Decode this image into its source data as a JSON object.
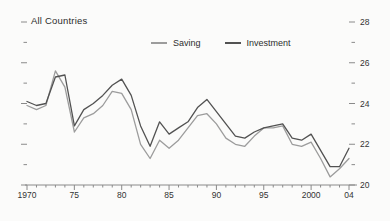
{
  "title": "All Countries",
  "legend": {
    "items": [
      {
        "label": "Saving",
        "color": "#9c9c9c"
      },
      {
        "label": "Investment",
        "color": "#525252"
      }
    ]
  },
  "colors": {
    "axis": "#8a8a8a",
    "tick": "#8a8a8a",
    "text": "#333333",
    "background": "#fbfbfa",
    "saving_line": "#9c9c9c",
    "investment_line": "#525252"
  },
  "chart_data": {
    "type": "line",
    "title": "All Countries",
    "xlabel": "",
    "ylabel": "",
    "xlim": [
      1970,
      2004
    ],
    "ylim": [
      20,
      28
    ],
    "grid": false,
    "legend_position": "top-center",
    "value_axis_side": "right",
    "x": [
      1970,
      1971,
      1972,
      1973,
      1974,
      1975,
      1976,
      1977,
      1978,
      1979,
      1980,
      1981,
      1982,
      1983,
      1984,
      1985,
      1986,
      1987,
      1988,
      1989,
      1990,
      1991,
      1992,
      1993,
      1994,
      1995,
      1996,
      1997,
      1998,
      1999,
      2000,
      2001,
      2002,
      2003,
      2004
    ],
    "series": [
      {
        "name": "Saving",
        "color": "#9c9c9c",
        "values": [
          23.9,
          23.7,
          23.9,
          25.6,
          24.8,
          22.6,
          23.3,
          23.5,
          23.9,
          24.6,
          24.5,
          23.7,
          22.0,
          21.3,
          22.2,
          21.8,
          22.2,
          22.8,
          23.4,
          23.5,
          23.0,
          22.3,
          22.0,
          21.9,
          22.4,
          22.8,
          22.8,
          22.9,
          22.0,
          21.9,
          22.1,
          21.3,
          20.4,
          20.8,
          21.3
        ]
      },
      {
        "name": "Investment",
        "color": "#525252",
        "values": [
          24.1,
          23.9,
          24.0,
          25.3,
          25.4,
          22.9,
          23.7,
          24.0,
          24.4,
          24.9,
          25.2,
          24.4,
          22.9,
          21.9,
          23.1,
          22.5,
          22.8,
          23.1,
          23.8,
          24.2,
          23.6,
          23.0,
          22.4,
          22.3,
          22.6,
          22.8,
          22.9,
          23.0,
          22.3,
          22.2,
          22.5,
          21.7,
          20.9,
          20.9,
          21.8
        ]
      }
    ],
    "x_ticks": [
      {
        "value": 1970,
        "label": "1970"
      },
      {
        "value": 1975,
        "label": "75"
      },
      {
        "value": 1980,
        "label": "80"
      },
      {
        "value": 1985,
        "label": "85"
      },
      {
        "value": 1990,
        "label": "90"
      },
      {
        "value": 1995,
        "label": "95"
      },
      {
        "value": 2000,
        "label": "2000"
      },
      {
        "value": 2004,
        "label": "04"
      }
    ],
    "x_minor_tick_step": 1,
    "y_ticks": [
      {
        "value": 20,
        "label": "20"
      },
      {
        "value": 22,
        "label": "22"
      },
      {
        "value": 24,
        "label": "24"
      },
      {
        "value": 26,
        "label": "26"
      },
      {
        "value": 28,
        "label": "28"
      }
    ],
    "y_minor_ticks": [
      21,
      23,
      25,
      27
    ]
  }
}
